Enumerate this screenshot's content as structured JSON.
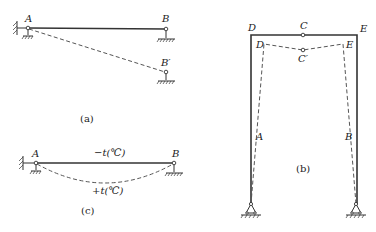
{
  "figure_a": {
    "caption": "(a)",
    "labels": {
      "A": "A",
      "B": "B",
      "B_prime": "B′"
    },
    "description": "Simple beam AB; support B settles to B'; rigid-body rotation shown dashed"
  },
  "figure_b": {
    "caption": "(b)",
    "labels": {
      "D": "D",
      "C": "C",
      "E": "E",
      "D_prime": "D",
      "E_prime": "E",
      "C_prime": "C′",
      "A": "A",
      "B": "B"
    },
    "description": "Three-hinged portal frame ADCEB; deformed shape D'C'E' shown dashed"
  },
  "figure_c": {
    "caption": "(c)",
    "labels": {
      "A": "A",
      "B": "B",
      "top_temp": "−t(℃)",
      "bottom_temp": "+t(℃)"
    },
    "description": "Simple beam with temperature change; deflected curve shown dashed"
  },
  "colors": {
    "line": "#333333",
    "dashed": "#555555",
    "background": "#ffffff"
  }
}
